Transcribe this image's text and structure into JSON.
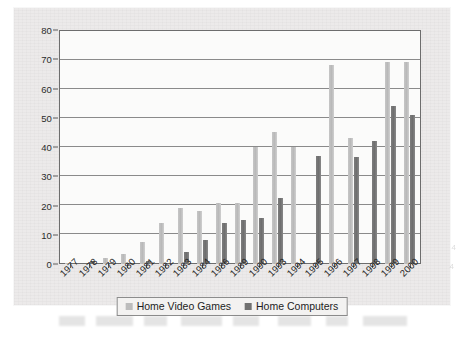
{
  "figure": {
    "background_color": "#eceaea",
    "plot_background_color": "#fbfbfa",
    "axis_color": "#6d6d6d"
  },
  "legend": {
    "position": "bottom-center",
    "entries": [
      {
        "label": "Home Video Games",
        "color": "#bcbcbc",
        "swatch_name": "legend-swatch-home-video-games"
      },
      {
        "label": "Home Computers",
        "color": "#717171",
        "swatch_name": "legend-swatch-home-computers"
      }
    ]
  },
  "chart_data": {
    "type": "bar",
    "title": "",
    "subtitle": "",
    "xlabel": "",
    "ylabel": "",
    "ylim": [
      0,
      80
    ],
    "ytick_values": [
      0,
      10,
      20,
      30,
      40,
      50,
      60,
      70,
      80
    ],
    "ytick_labels": [
      "0",
      "10",
      "20",
      "30",
      "40",
      "50",
      "60",
      "70",
      "80"
    ],
    "grid": true,
    "grid_axis": "y",
    "legend_position": "bottom-center",
    "categories": [
      "1977",
      "1978",
      "1979",
      "1980",
      "1981",
      "1982",
      "1983",
      "1984",
      "1986",
      "1989",
      "1990",
      "1993",
      "1994",
      "1995",
      "1996",
      "1997",
      "1998",
      "1999",
      "2000"
    ],
    "series": [
      {
        "name": "Home Video Games",
        "color": "#bcbcbc",
        "values": [
          0.5,
          0,
          2.2,
          3.4,
          7.4,
          14.0,
          19.0,
          18.0,
          21.0,
          21.0,
          40.0,
          45.0,
          40.0,
          0,
          68.0,
          43.0,
          0,
          69.0,
          69.0
        ]
      },
      {
        "name": "Home Computers",
        "color": "#717171",
        "values": [
          0,
          1.0,
          0,
          0,
          1.0,
          0,
          4.0,
          8.2,
          14.0,
          15.0,
          15.8,
          22.5,
          0,
          37.0,
          0,
          36.5,
          42.0,
          54.0,
          51.0
        ]
      }
    ]
  }
}
